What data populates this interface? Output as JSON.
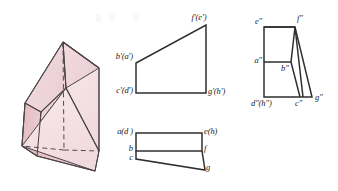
{
  "plate": {
    "title": "Orthographic projection plate of an oblique wedge prism",
    "background_color": "#ffffff",
    "line_color": "#3a3a3a",
    "label_color": "#1b1b1b",
    "solid_fill_light": "#f6e3e6",
    "solid_fill_mid": "#efd3d8",
    "solid_fill_dark": "#e4bdc4"
  },
  "pictorial": {
    "name": "wedge-prism-pictorial",
    "description": "Shaded pink isometric wedge prism with dashed hidden edges"
  },
  "front_view": {
    "name": "front-view",
    "labels": {
      "top_left": "b'(a')",
      "bottom_left": "c'(d')",
      "top_right": "f'(e')",
      "bottom_right": "g'(h')"
    }
  },
  "top_view": {
    "name": "top-view",
    "labels": {
      "upper_left": "a(d )",
      "mid_left": "b",
      "lower_left": "c",
      "upper_right": "e(h)",
      "mid_right": "f",
      "lower_right": "g"
    }
  },
  "side_view": {
    "name": "side-view",
    "labels": {
      "top_left": "e″",
      "top_right": "f″",
      "mid_left": "a″",
      "mid_right": "b″",
      "bottom_left": "d″(h″)",
      "bottom_mid": "c″",
      "bottom_right": "g″"
    }
  }
}
